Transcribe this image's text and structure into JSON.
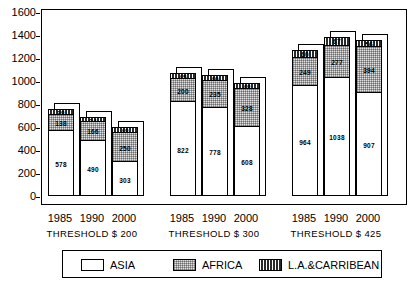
{
  "chart_data": {
    "type": "bar",
    "subtype": "stacked-bar-grouped",
    "title": "",
    "xlabel": "",
    "ylabel": "",
    "ylim": [
      0,
      1600
    ],
    "yticks": [
      0,
      200,
      400,
      600,
      800,
      1000,
      1200,
      1400,
      1600
    ],
    "grid": false,
    "legend_position": "bottom",
    "categories": [
      "1985",
      "1990",
      "2000",
      "1985",
      "1990",
      "2000",
      "1985",
      "1990",
      "2000"
    ],
    "groups": [
      {
        "label": "THRESHOLD $ 200",
        "years": [
          "1985",
          "1990",
          "2000"
        ]
      },
      {
        "label": "THRESHOLD $ 300",
        "years": [
          "1985",
          "1990",
          "2000"
        ]
      },
      {
        "label": "THRESHOLD $ 425",
        "years": [
          "1985",
          "1990",
          "2000"
        ]
      }
    ],
    "series": [
      {
        "name": "ASIA",
        "color": "#ffffff",
        "values": [
          578,
          490,
          303,
          822,
          778,
          608,
          964,
          1038,
          907
        ]
      },
      {
        "name": "AFRICA",
        "color": "#e2e2e2",
        "values": [
          138,
          166,
          250,
          200,
          235,
          328,
          249,
          277,
          394
        ]
      },
      {
        "name": "L.A.&CARRIBEAN",
        "color": "#2a2a2a",
        "values": [
          38,
          34,
          48,
          45,
          40,
          48,
          60,
          67,
          56
        ]
      }
    ],
    "totals": [
      754,
      690,
      601,
      1067,
      1053,
      984,
      1273,
      1382,
      1357
    ]
  },
  "axis": {
    "y_ticks": [
      "1600",
      "1400",
      "1200",
      "1000",
      "800",
      "600",
      "400",
      "200",
      "0"
    ]
  },
  "xaxis": {
    "years": [
      "1985",
      "1990",
      "2000",
      "1985",
      "1990",
      "2000",
      "1985",
      "1990",
      "2000"
    ],
    "thresholds": [
      "THRESHOLD $ 200",
      "THRESHOLD $ 300",
      "THRESHOLD $ 425"
    ]
  },
  "legend": {
    "items": [
      {
        "label": "ASIA",
        "swatch": "asia"
      },
      {
        "label": "AFRICA",
        "swatch": "africa"
      },
      {
        "label": "L.A.&CARRIBEAN",
        "swatch": "la"
      }
    ]
  },
  "bar_labels": {
    "asia": [
      "578",
      "490",
      "303",
      "822",
      "778",
      "608",
      "964",
      "1038",
      "907"
    ],
    "africa": [
      "138",
      "166",
      "250",
      "200",
      "235",
      "328",
      "249",
      "277",
      "394"
    ],
    "la": [
      "38",
      "34",
      "48",
      "45",
      "40",
      "48",
      "60",
      "67",
      "56"
    ]
  }
}
